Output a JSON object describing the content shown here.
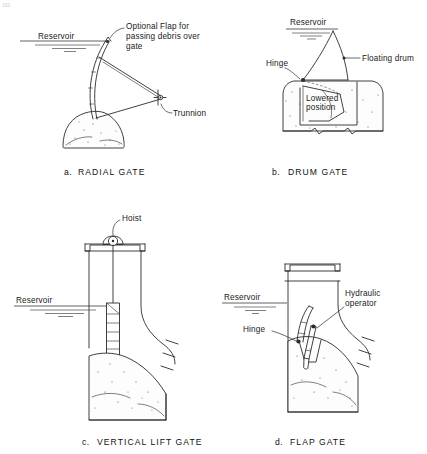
{
  "figure": {
    "corner_mark": "331",
    "background_color": "#ffffff",
    "ink_color": "#2b2b2b"
  },
  "panels": [
    {
      "id": "radial-gate",
      "caption_letter": "a.",
      "caption_title": "RADIAL  GATE",
      "labels": {
        "reservoir": "Reservoir",
        "flap_line1": "Optional Flap for",
        "flap_line2": "passing debris over",
        "flap_line3": "gate",
        "trunnion": "Trunnion"
      }
    },
    {
      "id": "drum-gate",
      "caption_letter": "b.",
      "caption_title": "DRUM  GATE",
      "labels": {
        "reservoir": "Reservoir",
        "floating_drum": "Floating drum",
        "hinge": "Hinge",
        "lowered_line1": "Lowered",
        "lowered_line2": "position"
      }
    },
    {
      "id": "vertical-lift-gate",
      "caption_letter": "c.",
      "caption_title": "VERTICAL  LIFT  GATE",
      "labels": {
        "reservoir": "Reservoir",
        "hoist": "Hoist"
      }
    },
    {
      "id": "flap-gate",
      "caption_letter": "d.",
      "caption_title": "FLAP  GATE",
      "labels": {
        "reservoir": "Reservoir",
        "hydraulic_line1": "Hydraulic",
        "hydraulic_line2": "operator",
        "hinge": "Hinge"
      }
    }
  ]
}
